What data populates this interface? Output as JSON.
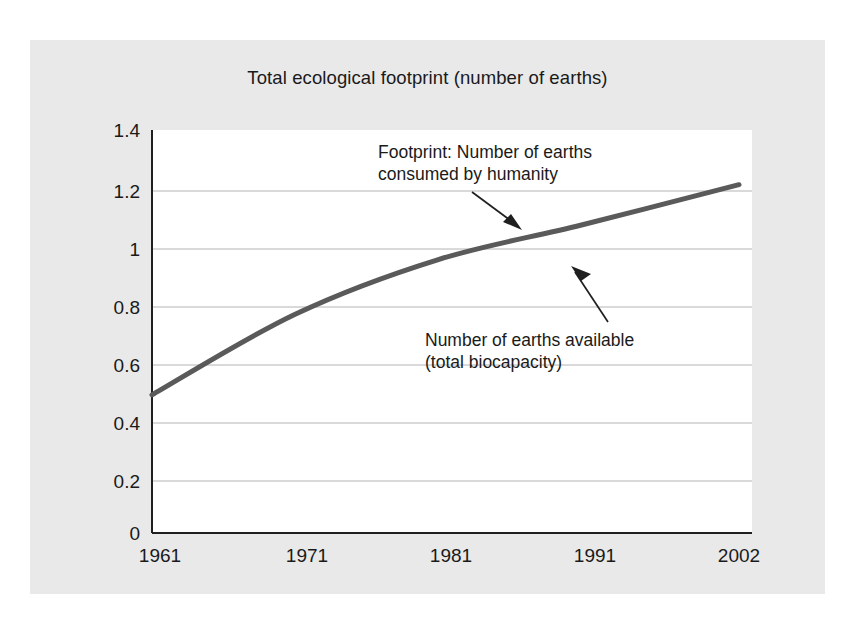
{
  "figure": {
    "background_color": "#e9e9e9",
    "plot_background_color": "#ffffff",
    "page_background_color": "#ffffff"
  },
  "chart_data": {
    "type": "line",
    "title": "Total ecological footprint (number of earths)",
    "xlabel": "",
    "ylabel": "",
    "x": [
      1961,
      1971,
      1981,
      1991,
      2002
    ],
    "categories": [
      "1961",
      "1971",
      "1981",
      "1991",
      "2002"
    ],
    "series": [
      {
        "name": "Footprint: Number of earths consumed by humanity",
        "color": "#5a5a5a",
        "values": [
          0.48,
          0.76,
          0.95,
          1.07,
          1.21
        ]
      }
    ],
    "xtick_labels": [
      "1961",
      "1971",
      "1981",
      "1991",
      "2002"
    ],
    "ytick_labels": [
      "0",
      "0.2",
      "0.4",
      "0.6",
      "0.8",
      "1",
      "1.2",
      "1.4"
    ],
    "ytick_values": [
      0,
      0.2,
      0.4,
      0.6,
      0.8,
      1,
      1.2,
      1.4
    ],
    "ylim": [
      0,
      1.4
    ],
    "xlim": [
      1961,
      2002
    ],
    "grid": "horizontal",
    "legend": "none",
    "annotations": [
      {
        "id": "footprint-annotation",
        "lines": [
          "Footprint: Number of earths",
          "consumed by humanity"
        ],
        "arrow": "down-right"
      },
      {
        "id": "biocapacity-annotation",
        "lines": [
          "Number of earths available",
          "(total biocapacity)"
        ],
        "arrow": "up-right"
      }
    ]
  }
}
